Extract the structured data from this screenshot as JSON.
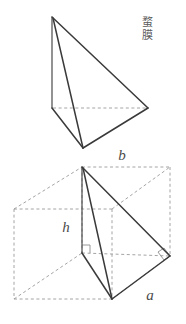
{
  "figure": {
    "caption_cjk": "蝥\n膜",
    "labels": {
      "b": "b",
      "h": "h",
      "a": "a"
    },
    "colors": {
      "solid_edge": "#3a3a3a",
      "hidden_edge": "#9a9a9a",
      "label_text": "#4a4a4a",
      "background": "#ffffff"
    },
    "top_solid": {
      "name": "tetrahedron-outline",
      "vertices": {
        "apex": [
          52,
          17
        ],
        "left": [
          52,
          108
        ],
        "right": [
          148,
          108
        ],
        "front": [
          83,
          148
        ]
      },
      "solid_edges": [
        [
          [
            52,
            17
          ],
          [
            148,
            108
          ]
        ],
        [
          [
            52,
            17
          ],
          [
            52,
            108
          ]
        ],
        [
          [
            52,
            17
          ],
          [
            83,
            148
          ]
        ],
        [
          [
            52,
            108
          ],
          [
            83,
            148
          ]
        ],
        [
          [
            83,
            148
          ],
          [
            148,
            108
          ]
        ]
      ],
      "hidden_edges": [
        [
          [
            52,
            108
          ],
          [
            148,
            108
          ]
        ]
      ]
    },
    "bottom_solid": {
      "name": "tetrahedron-in-prism",
      "vertices": {
        "apex": [
          82,
          167
        ],
        "foot": [
          82,
          253
        ],
        "front": [
          112,
          299
        ],
        "right": [
          170,
          256
        ]
      },
      "box": {
        "front_bottom_left": [
          14,
          299
        ],
        "front_top_left": [
          14,
          209
        ],
        "front_bottom_right": [
          112,
          299
        ],
        "front_top_right": [
          112,
          209
        ],
        "back_bottom_left": [
          82,
          253
        ],
        "back_top_left": [
          82,
          167
        ],
        "back_bottom_right": [
          170,
          256
        ],
        "back_top_right": [
          170,
          167
        ]
      },
      "right_angle_marks": [
        [
          82,
          253
        ],
        [
          170,
          256
        ]
      ]
    }
  }
}
